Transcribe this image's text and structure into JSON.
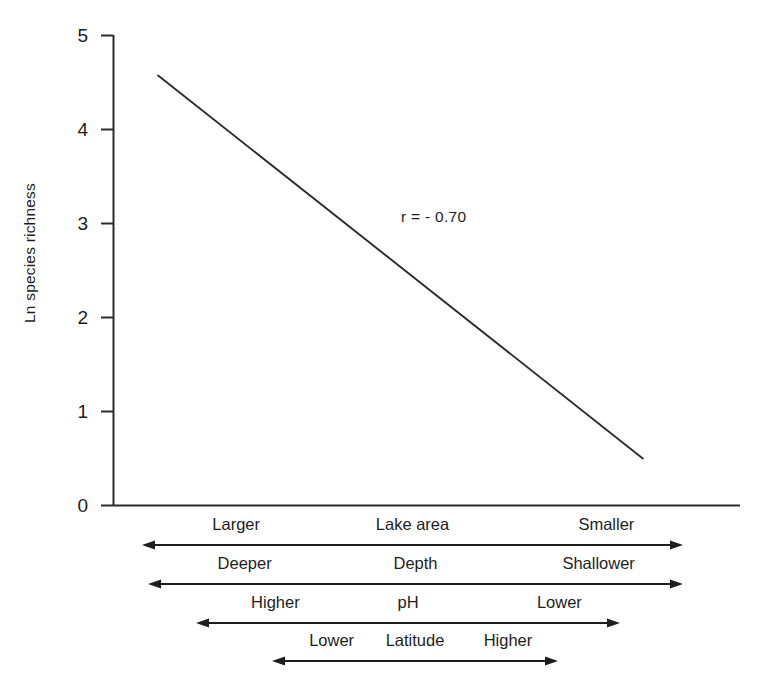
{
  "chart_data": {
    "type": "line",
    "title": "",
    "xlabel": "",
    "ylabel": "Ln species richness",
    "ylim": [
      0,
      5
    ],
    "yticks": [
      0,
      1,
      2,
      3,
      4,
      5
    ],
    "ytick_labels": [
      "0",
      "1",
      "2",
      "3",
      "4",
      "5"
    ],
    "grid": false,
    "legend": "none",
    "annotations": [
      {
        "text": "r = - 0.70",
        "x_frac": 0.46,
        "y_value": 3.05
      }
    ],
    "series": [
      {
        "name": "trend line",
        "style": "solid",
        "color": "#2b2b2b",
        "points": [
          {
            "x_frac": 0.072,
            "y": 4.57
          },
          {
            "x_frac": 0.845,
            "y": 0.5
          }
        ]
      }
    ],
    "gradient_axes": [
      {
        "left_label": "Larger",
        "center_label": "Lake area",
        "right_label": "Smaller"
      },
      {
        "left_label": "Deeper",
        "center_label": "Depth",
        "right_label": "Shallower"
      },
      {
        "left_label": "Higher",
        "center_label": "pH",
        "right_label": "Lower"
      },
      {
        "left_label": "Lower",
        "center_label": "Latitude",
        "right_label": "Higher"
      }
    ]
  },
  "axis": {
    "y_label": "Ln species richness",
    "ticks": [
      "5",
      "4",
      "3",
      "2",
      "1",
      "0"
    ]
  },
  "annotation": {
    "correlation": "r = - 0.70"
  },
  "gradients": [
    {
      "left": "Larger",
      "center": "Lake area",
      "right": "Smaller"
    },
    {
      "left": "Deeper",
      "center": "Depth",
      "right": "Shallower"
    },
    {
      "left": "Higher",
      "center": "pH",
      "right": "Lower"
    },
    {
      "left": "Lower",
      "center": "Latitude",
      "right": "Higher"
    }
  ],
  "colors": {
    "ink": "#1d1d1d",
    "line": "#2b2b2b",
    "background": "#ffffff"
  }
}
